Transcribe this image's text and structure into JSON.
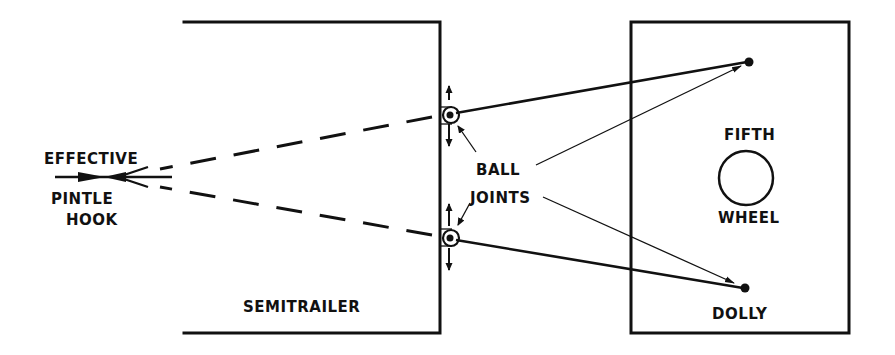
{
  "diagram": {
    "labels": {
      "effective": "EFFECTIVE",
      "pintle": "PINTLE",
      "hook": "HOOK",
      "ball": "BALL",
      "joints": "JOINTS",
      "fifth": "FIFTH",
      "wheel": "WHEEL",
      "semitrailer": "SEMITRAILER",
      "dolly": "DOLLY"
    },
    "colors": {
      "ink": "#111111",
      "background": "#ffffff"
    }
  }
}
